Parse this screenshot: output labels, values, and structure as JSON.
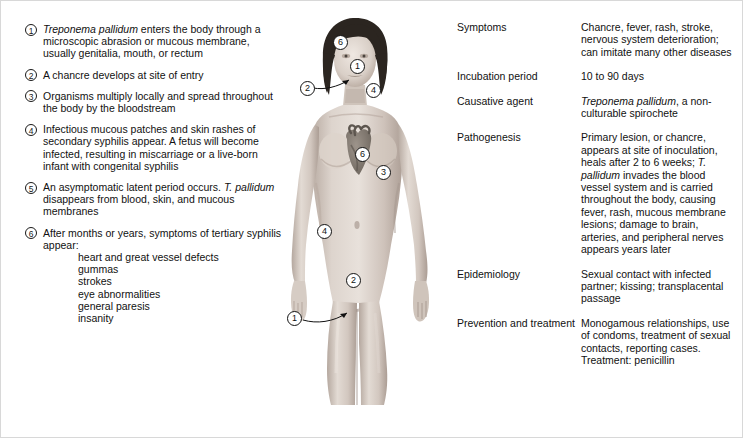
{
  "figure": {
    "alt_name": "female-body-syphilis-diagram",
    "callouts": [
      {
        "id": "head-6",
        "label": "6",
        "x": 44,
        "y": 22
      },
      {
        "id": "face-1",
        "label": "1",
        "x": 61,
        "y": 46
      },
      {
        "id": "mouth-2",
        "label": "2",
        "x": 11,
        "y": 68
      },
      {
        "id": "neck-4",
        "label": "4",
        "x": 77,
        "y": 70
      },
      {
        "id": "heart-6",
        "label": "6",
        "x": 66,
        "y": 134
      },
      {
        "id": "chest-3",
        "label": "3",
        "x": 87,
        "y": 152
      },
      {
        "id": "hip-4",
        "label": "4",
        "x": 28,
        "y": 211
      },
      {
        "id": "abdomen-2",
        "label": "2",
        "x": 57,
        "y": 260
      },
      {
        "id": "groin-1",
        "label": "1",
        "x": -2,
        "y": 298
      }
    ]
  },
  "steps": [
    {
      "number": "1",
      "italic_lead": "Treponema pallidum",
      "text": " enters the body through a microscopic abrasion or mucous membrane, usually genitalia, mouth, or rectum"
    },
    {
      "number": "2",
      "italic_lead": "",
      "text": "A chancre develops at site of entry"
    },
    {
      "number": "3",
      "italic_lead": "",
      "text": "Organisms multiply locally and spread throughout the body by the bloodstream"
    },
    {
      "number": "4",
      "italic_lead": "",
      "text": "Infectious mucous patches and skin rashes of secondary syphilis appear. A fetus will become infected, resulting in miscarriage or a live-born infant with congenital syphilis"
    },
    {
      "number": "5",
      "italic_lead": "",
      "text_before": "An asymptomatic latent period occurs. ",
      "italic_mid": "T. pallidum",
      "text_after": " disappears from blood, skin, and mucous membranes"
    },
    {
      "number": "6",
      "italic_lead": "",
      "text": "After months or years, symptoms of tertiary syphilis appear:",
      "sublist": [
        "heart and great vessel defects",
        "gummas",
        "strokes",
        "eye abnormalities",
        "general paresis",
        "insanity"
      ]
    }
  ],
  "info_table": {
    "rows": [
      {
        "label": "Symptoms",
        "value": "Chancre, fever, rash, stroke, nervous system deterioration; can imitate many other diseases"
      },
      {
        "label": "Incubation period",
        "value": "10 to 90 days"
      },
      {
        "label": "Causative agent",
        "italic_lead": "Treponema pallidum",
        "value": ", a non-culturable spirochete"
      },
      {
        "label": "Pathogenesis",
        "value_before": "Primary lesion, or chancre, appears at site of inoculation, heals after 2 to 6 weeks; ",
        "italic_mid": "T. pallidum",
        "value_after": " invades the blood vessel system and is carried throughout the body, causing fever, rash, mucous membrane lesions; damage to brain, arteries, and peripheral nerves appears years later"
      },
      {
        "label": "Epidemiology",
        "value": "Sexual contact with infected partner; kissing; transplacental passage"
      },
      {
        "label": "Prevention and treatment",
        "value": "Monogamous relationships, use of condoms, treatment of sexual contacts, reporting cases. Treatment: penicillin"
      }
    ]
  },
  "colors": {
    "border": "#d8d8d8",
    "text": "#111111",
    "skin_light": "#e4dcd6",
    "skin_mid": "#cfc3bb",
    "skin_shadow": "#b4a69d",
    "hair": "#2e2823",
    "heart": "#8a8178"
  }
}
